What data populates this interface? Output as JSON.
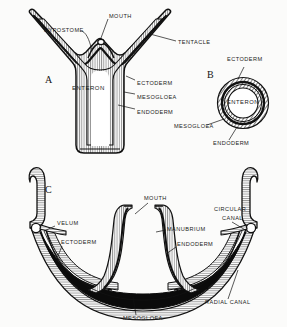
{
  "figure": {
    "kind": "scientific-illustration",
    "background_color": "#fbfbfa",
    "ink_color": "#111111",
    "panels": [
      {
        "letter": "A",
        "name": "hydra-polyp-longitudinal-section",
        "labels": [
          {
            "id": "hypostome",
            "text": "HYPOSTOME",
            "x": 44,
            "y": 28
          },
          {
            "id": "mouth",
            "text": "MOUTH",
            "x": 109,
            "y": 14
          },
          {
            "id": "tentacle",
            "text": "TENTACLE",
            "x": 178,
            "y": 40
          },
          {
            "id": "enteron",
            "text": "ENTERON",
            "x": 72,
            "y": 85
          },
          {
            "id": "ectoderm",
            "text": "ECTODERM",
            "x": 137,
            "y": 81
          },
          {
            "id": "mesogloea",
            "text": "MESOGLOEA",
            "x": 137,
            "y": 95
          },
          {
            "id": "endoderm",
            "text": "ENDODERM",
            "x": 137,
            "y": 110
          }
        ]
      },
      {
        "letter": "B",
        "name": "transverse-section",
        "labels": [
          {
            "id": "ectoderm",
            "text": "ECTODERM",
            "x": 227,
            "y": 60
          },
          {
            "id": "enteron",
            "text": "ENTERON",
            "x": 227,
            "y": 103
          },
          {
            "id": "mesogloea",
            "text": "MESOGLOEA",
            "x": 174,
            "y": 127
          },
          {
            "id": "endoderm",
            "text": "ENDODERM",
            "x": 213,
            "y": 144
          }
        ]
      },
      {
        "letter": "C",
        "name": "medusa-vertical-section",
        "labels": [
          {
            "id": "mouth",
            "text": "MOUTH",
            "x": 144,
            "y": 199
          },
          {
            "id": "velum",
            "text": "VELUM",
            "x": 57,
            "y": 224
          },
          {
            "id": "ectoderm",
            "text": "ECTODERM",
            "x": 61,
            "y": 243
          },
          {
            "id": "manubrium",
            "text": "MANUBRIUM",
            "x": 167,
            "y": 230
          },
          {
            "id": "endoderm",
            "text": "ENDODERM",
            "x": 177,
            "y": 245
          },
          {
            "id": "circular-canal-line1",
            "text": "CIRCULAR",
            "x": 214,
            "y": 210
          },
          {
            "id": "circular-canal-line2",
            "text": "CANAL",
            "x": 222,
            "y": 219
          },
          {
            "id": "radial-canal",
            "text": "RADIAL  CANAL",
            "x": 205,
            "y": 303
          },
          {
            "id": "mesogloea",
            "text": "MESOGLOEA",
            "x": 123,
            "y": 319
          }
        ]
      }
    ],
    "letters": [
      {
        "id": "panel-letter-a",
        "text": "A",
        "x": 45,
        "y": 75
      },
      {
        "id": "panel-letter-b",
        "text": "B",
        "x": 207,
        "y": 70
      },
      {
        "id": "panel-letter-c",
        "text": "C",
        "x": 45,
        "y": 185
      }
    ]
  }
}
